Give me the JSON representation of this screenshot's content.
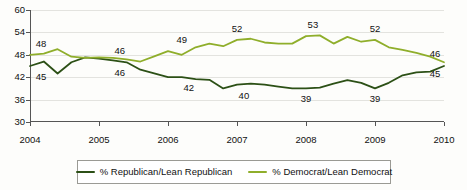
{
  "chart_data": {
    "type": "line",
    "title": "",
    "xlabel": "",
    "ylabel": "",
    "ylim": [
      30,
      60
    ],
    "xlim": [
      2004,
      2010
    ],
    "grid": true,
    "legend_position": "bottom",
    "yticks": [
      30,
      36,
      42,
      48,
      54,
      60
    ],
    "xticks": [
      2004,
      2005,
      2006,
      2007,
      2008,
      2009,
      2010
    ],
    "series": [
      {
        "name": "% Republican/Lean Republican",
        "color": "#2c5016",
        "x": [
          2004.0,
          2004.2,
          2004.4,
          2004.6,
          2004.8,
          2005.0,
          2005.2,
          2005.4,
          2005.6,
          2005.8,
          2006.0,
          2006.2,
          2006.4,
          2006.6,
          2006.8,
          2007.0,
          2007.2,
          2007.4,
          2007.6,
          2007.8,
          2008.0,
          2008.2,
          2008.4,
          2008.6,
          2008.8,
          2009.0,
          2009.2,
          2009.4,
          2009.6,
          2009.8,
          2010.0
        ],
        "values": [
          45.0,
          46.2,
          43.0,
          46.0,
          47.3,
          47.0,
          46.5,
          46.0,
          44.0,
          43.0,
          42.0,
          42.0,
          41.5,
          41.3,
          39.0,
          40.0,
          40.3,
          40.0,
          39.5,
          39.0,
          39.0,
          39.2,
          40.3,
          41.2,
          40.5,
          39.0,
          40.5,
          42.5,
          43.3,
          43.5,
          45.0
        ],
        "point_labels": [
          {
            "x": 2004.0,
            "y": 45.0,
            "text": "45"
          },
          {
            "x": 2005.3,
            "y": 46.0,
            "text": "46"
          },
          {
            "x": 2006.3,
            "y": 42.0,
            "text": "42"
          },
          {
            "x": 2007.1,
            "y": 40.0,
            "text": "40"
          },
          {
            "x": 2008.0,
            "y": 39.0,
            "text": "39"
          },
          {
            "x": 2009.0,
            "y": 39.0,
            "text": "39"
          },
          {
            "x": 2010.0,
            "y": 45.0,
            "text": "45"
          }
        ]
      },
      {
        "name": "% Democrat/Lean Democrat",
        "color": "#8fae2b",
        "x": [
          2004.0,
          2004.2,
          2004.4,
          2004.6,
          2004.8,
          2005.0,
          2005.2,
          2005.4,
          2005.6,
          2005.8,
          2006.0,
          2006.2,
          2006.4,
          2006.6,
          2006.8,
          2007.0,
          2007.2,
          2007.4,
          2007.6,
          2007.8,
          2008.0,
          2008.2,
          2008.4,
          2008.6,
          2008.8,
          2009.0,
          2009.2,
          2009.4,
          2009.6,
          2009.8,
          2010.0
        ],
        "values": [
          48.0,
          48.3,
          49.5,
          47.5,
          47.2,
          47.3,
          47.2,
          46.8,
          46.2,
          47.6,
          49.0,
          48.0,
          50.0,
          51.0,
          50.3,
          52.0,
          52.3,
          51.3,
          51.0,
          51.0,
          53.0,
          53.2,
          51.0,
          52.8,
          51.5,
          52.0,
          50.0,
          49.3,
          48.5,
          47.5,
          46.0
        ],
        "point_labels": [
          {
            "x": 2004.0,
            "y": 48.0,
            "text": "48"
          },
          {
            "x": 2005.3,
            "y": 46.2,
            "text": "46"
          },
          {
            "x": 2006.2,
            "y": 49.0,
            "text": "49"
          },
          {
            "x": 2007.0,
            "y": 52.0,
            "text": "52"
          },
          {
            "x": 2008.1,
            "y": 53.0,
            "text": "53"
          },
          {
            "x": 2009.0,
            "y": 52.0,
            "text": "52"
          },
          {
            "x": 2010.0,
            "y": 46.0,
            "text": "46"
          }
        ]
      }
    ]
  },
  "legend": {
    "items": [
      {
        "label": "% Republican/Lean Republican",
        "color": "#2c5016"
      },
      {
        "label": "% Democrat/Lean Democrat",
        "color": "#8fae2b"
      }
    ]
  }
}
